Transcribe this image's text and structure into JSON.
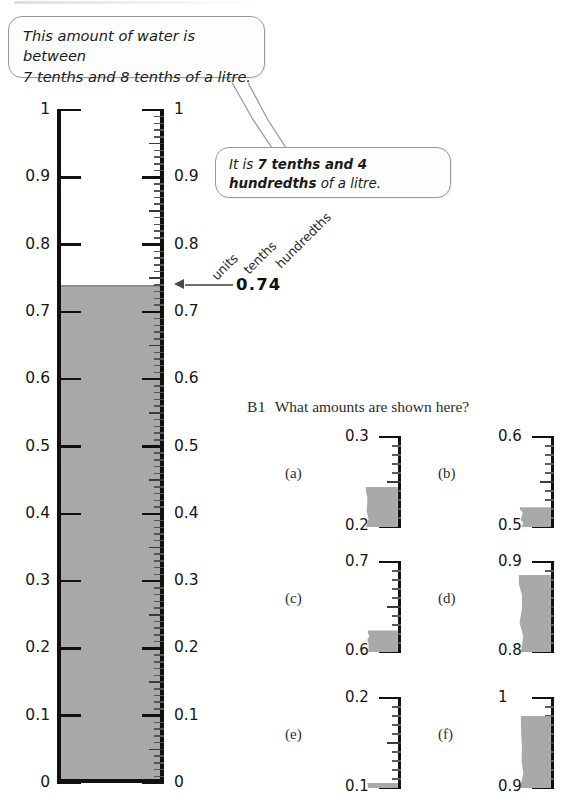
{
  "bubbles": [
    {
      "id": "statement-bubble",
      "line1": "This amount of water is between",
      "line2": "7 tenths and 8 tenths of a litre."
    },
    {
      "id": "answer-bubble",
      "prefix": "It is ",
      "bold": "7 tenths and 4 hundredths",
      "suffix": " of a litre."
    }
  ],
  "main_scale": {
    "reading": "0.74",
    "min": 0,
    "max": 1,
    "water_level": 0.74,
    "left_labels": [
      "1",
      "0.9",
      "0.8",
      "0.7",
      "0.6",
      "0.5",
      "0.4",
      "0.3",
      "0.2",
      "0.1",
      "0"
    ],
    "right_labels": [
      "1",
      "0.9",
      "0.8",
      "0.7",
      "0.6",
      "0.5",
      "0.4",
      "0.3",
      "0.2",
      "0.1",
      "0"
    ],
    "column_words": [
      "units",
      "tenths",
      "hundredths"
    ]
  },
  "question": {
    "number": "B1",
    "text": "What amounts are shown here?",
    "items": [
      {
        "letter": "(a)",
        "top_label": "0.3",
        "bottom_label": "0.2",
        "fill_fraction": 0.45
      },
      {
        "letter": "(b)",
        "top_label": "0.6",
        "bottom_label": "0.5",
        "fill_fraction": 0.22
      },
      {
        "letter": "(c)",
        "top_label": "0.7",
        "bottom_label": "0.6",
        "fill_fraction": 0.24
      },
      {
        "letter": "(d)",
        "top_label": "0.9",
        "bottom_label": "0.8",
        "fill_fraction": 0.86
      },
      {
        "letter": "(e)",
        "top_label": "0.2",
        "bottom_label": "0.1",
        "fill_fraction": 0.06
      },
      {
        "letter": "(f)",
        "top_label": "1",
        "bottom_label": "0.9",
        "fill_fraction": 0.8
      }
    ]
  },
  "colors": {
    "water": "#a9a9a9",
    "outline": "#111111",
    "bubble_border": "#9a9a9a",
    "arrow": "#6e6e6e"
  }
}
